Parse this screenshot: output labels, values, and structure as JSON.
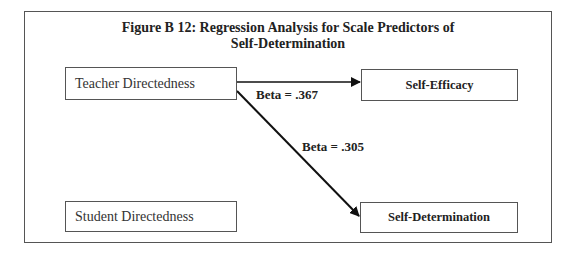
{
  "figure": {
    "title_line1": "Figure B 12: Regression Analysis for Scale Predictors of",
    "title_line2": "Self-Determination"
  },
  "nodes": {
    "teacher_directedness": "Teacher Directedness",
    "student_directedness": "Student Directedness",
    "self_efficacy": "Self-Efficacy",
    "self_determination": "Self-Determination"
  },
  "edges": [
    {
      "from": "Teacher Directedness",
      "to": "Self-Efficacy",
      "label": "Beta = .367"
    },
    {
      "from": "Teacher Directedness",
      "to": "Self-Determination",
      "label": "Beta = .305"
    }
  ],
  "colors": {
    "line": "#111111",
    "border": "#555555",
    "text": "#222222"
  }
}
